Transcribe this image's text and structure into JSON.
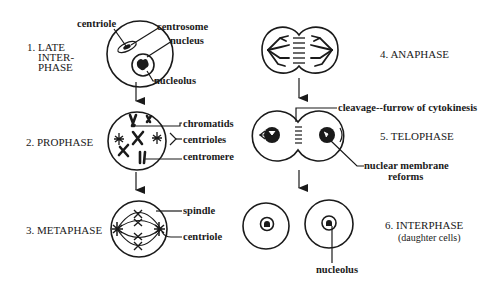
{
  "diagram": {
    "type": "cell-division-mitosis-stages",
    "stages": [
      {
        "number": "1.",
        "lines": [
          "1. LATE",
          "INTER-",
          "PHASE"
        ],
        "labels": [
          "centriole",
          "centrosome",
          "nucleus",
          "nucleolus"
        ]
      },
      {
        "number": "2.",
        "lines": [
          "2. PROPHASE"
        ],
        "labels": [
          "chromatids",
          "centrioles",
          "centromere"
        ]
      },
      {
        "number": "3.",
        "lines": [
          "3. METAPHASE"
        ],
        "labels": [
          "spindle",
          "centriole"
        ]
      },
      {
        "number": "4.",
        "lines": [
          "4. ANAPHASE"
        ],
        "labels": []
      },
      {
        "number": "5.",
        "lines": [
          "5. TELOPHASE"
        ],
        "labels": [
          "cleavage--furrow of cytokinesis",
          "nuclear membrane",
          "reforms"
        ]
      },
      {
        "number": "6.",
        "lines": [
          "6. INTERPHASE",
          "(daughter cells)"
        ],
        "labels": [
          "nucleolus"
        ]
      }
    ]
  }
}
